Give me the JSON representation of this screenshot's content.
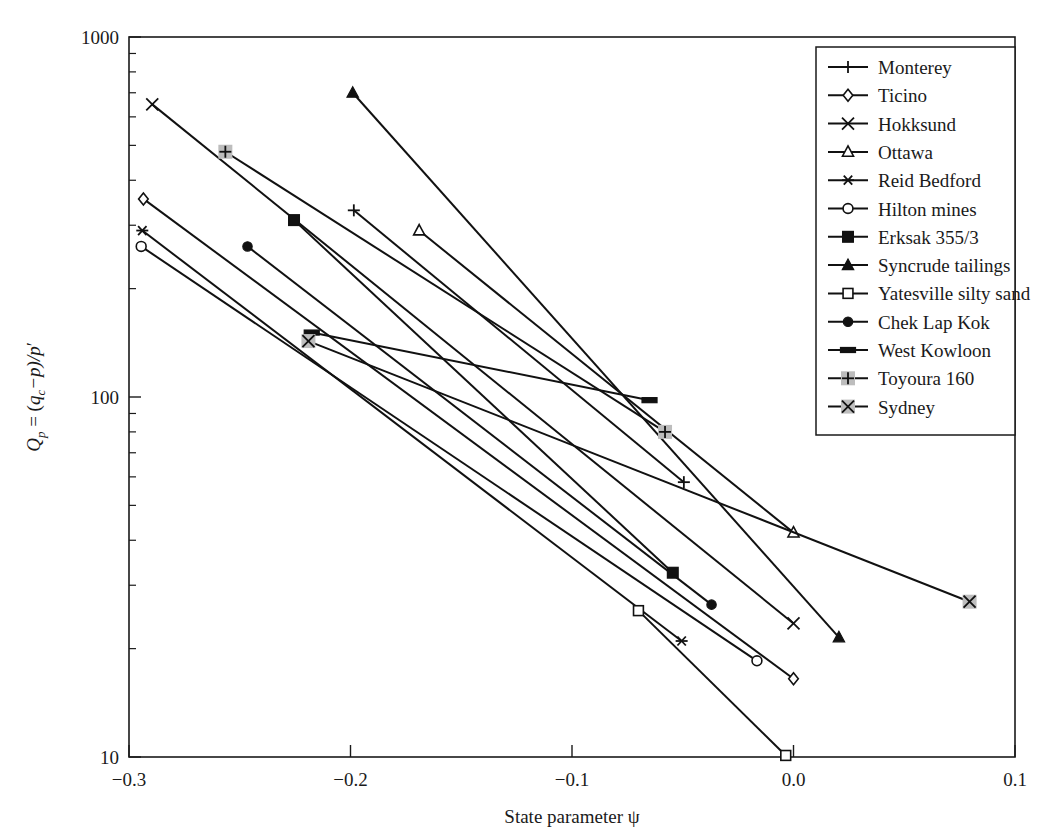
{
  "chart_data": {
    "type": "line",
    "title": "",
    "xlabel": "State parameter ψ",
    "ylabel": "Qₚ = (qc − p)/p′",
    "ylabel_parts": {
      "q_symbol": "Q",
      "q_sub": "p",
      "equals": " = (",
      "qc_symbol": "q",
      "qc_sub": "c",
      "mid": "−p)/p",
      "prime": "′"
    },
    "xscale": "linear",
    "yscale": "log",
    "xlim": [
      -0.3,
      0.1
    ],
    "ylim": [
      10,
      1000
    ],
    "xticks": [
      -0.3,
      -0.2,
      -0.1,
      0.0,
      0.1
    ],
    "xticklabels": [
      "−0.3",
      "−0.2",
      "−0.1",
      "0.0",
      "0.1"
    ],
    "yticks": [
      10,
      100,
      1000
    ],
    "yticklabels": [
      "10",
      "100",
      "1000"
    ],
    "grid": false,
    "legend_position": "top-right",
    "series": [
      {
        "name": "Monterey",
        "marker": "plus",
        "points": [
          {
            "x": -0.1985,
            "y": 330
          },
          {
            "x": -0.0495,
            "y": 58
          }
        ]
      },
      {
        "name": "Ticino",
        "marker": "diamond",
        "points": [
          {
            "x": -0.2935,
            "y": 355
          },
          {
            "x": 0.0,
            "y": 16.5
          }
        ]
      },
      {
        "name": "Hokksund",
        "marker": "x",
        "points": [
          {
            "x": -0.2895,
            "y": 650
          },
          {
            "x": 0.0,
            "y": 23.5
          }
        ]
      },
      {
        "name": "Ottawa",
        "marker": "triangle-open",
        "points": [
          {
            "x": -0.169,
            "y": 290
          },
          {
            "x": 0.0,
            "y": 42
          }
        ]
      },
      {
        "name": "Reid Bedford",
        "marker": "asterisk",
        "points": [
          {
            "x": -0.294,
            "y": 290
          },
          {
            "x": -0.0505,
            "y": 21
          }
        ]
      },
      {
        "name": "Hilton mines",
        "marker": "circle-open",
        "points": [
          {
            "x": -0.2945,
            "y": 262
          },
          {
            "x": -0.0165,
            "y": 18.5
          }
        ]
      },
      {
        "name": "Erksak 355/3",
        "marker": "square-filled",
        "points": [
          {
            "x": -0.2255,
            "y": 310
          },
          {
            "x": -0.0545,
            "y": 32.5
          }
        ]
      },
      {
        "name": "Syncrude tailings",
        "marker": "triangle-filled",
        "points": [
          {
            "x": -0.199,
            "y": 700
          },
          {
            "x": 0.0205,
            "y": 21.5
          }
        ]
      },
      {
        "name": "Yatesville silty sand",
        "marker": "square-open",
        "points": [
          {
            "x": -0.07,
            "y": 25.5
          },
          {
            "x": -0.0035,
            "y": 10.1
          }
        ]
      },
      {
        "name": "Chek Lap Kok",
        "marker": "circle-filled",
        "points": [
          {
            "x": -0.2465,
            "y": 262
          },
          {
            "x": -0.037,
            "y": 26.5
          }
        ]
      },
      {
        "name": "West Kowloon",
        "marker": "rect-filled",
        "points": [
          {
            "x": -0.2175,
            "y": 151
          },
          {
            "x": -0.065,
            "y": 98
          }
        ]
      },
      {
        "name": "Toyoura 160",
        "marker": "plus-shaded",
        "points": [
          {
            "x": -0.2565,
            "y": 480
          },
          {
            "x": -0.058,
            "y": 80
          }
        ]
      },
      {
        "name": "Sydney",
        "marker": "x-shaded",
        "points": [
          {
            "x": -0.219,
            "y": 143
          },
          {
            "x": 0.0795,
            "y": 27
          }
        ]
      }
    ]
  },
  "legend": {
    "items": [
      {
        "label": "Monterey",
        "marker": "plus"
      },
      {
        "label": "Ticino",
        "marker": "diamond"
      },
      {
        "label": "Hokksund",
        "marker": "x"
      },
      {
        "label": "Ottawa",
        "marker": "triangle-open"
      },
      {
        "label": "Reid Bedford",
        "marker": "asterisk"
      },
      {
        "label": "Hilton mines",
        "marker": "circle-open"
      },
      {
        "label": "Erksak 355/3",
        "marker": "square-filled"
      },
      {
        "label": "Syncrude tailings",
        "marker": "triangle-filled"
      },
      {
        "label": "Yatesville silty sand",
        "marker": "square-open"
      },
      {
        "label": "Chek Lap Kok",
        "marker": "circle-filled"
      },
      {
        "label": "West Kowloon",
        "marker": "rect-filled"
      },
      {
        "label": "Toyoura 160",
        "marker": "plus-shaded"
      },
      {
        "label": "Sydney",
        "marker": "x-shaded"
      }
    ]
  },
  "colors": {
    "ink": "#111111",
    "background": "#ffffff",
    "shaded_marker": "#bdbdbd"
  }
}
